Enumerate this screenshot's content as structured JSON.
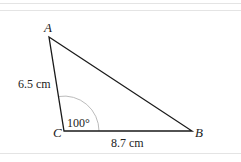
{
  "figure": {
    "type": "triangle",
    "vertices": {
      "A": {
        "label": "A",
        "x": 49,
        "y": 37
      },
      "B": {
        "label": "B",
        "x": 192,
        "y": 131
      },
      "C": {
        "label": "C",
        "x": 64,
        "y": 131
      }
    },
    "sides": {
      "AC": {
        "label": "6.5 cm"
      },
      "CB": {
        "label": "8.7 cm"
      }
    },
    "angles": {
      "C": {
        "label": "100°"
      }
    },
    "colors": {
      "stroke": "#1a1a1a",
      "arc": "#aaaaaa",
      "rule": "#e4e4e4"
    }
  }
}
